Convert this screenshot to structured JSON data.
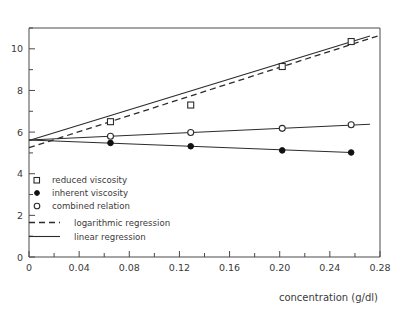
{
  "chart_data": {
    "type": "scatter",
    "title": "",
    "xlabel": "concentration (g/dl)",
    "ylabel": "",
    "xlim": [
      0,
      0.28
    ],
    "ylim": [
      0,
      11
    ],
    "grid": false,
    "legend_position": "inside-lower-left",
    "x_ticks": [
      "0",
      "0.04",
      "0.08",
      "0.12",
      "0.16",
      "0.20",
      "0.24",
      "0.28"
    ],
    "x_tick_values": [
      0,
      0.04,
      0.08,
      0.12,
      0.16,
      0.2,
      0.24,
      0.28
    ],
    "x_minor_tick_values": [
      0.02,
      0.06,
      0.1,
      0.14,
      0.18,
      0.22,
      0.26
    ],
    "y_ticks": [
      "0",
      "2",
      "4",
      "6",
      "8",
      "10"
    ],
    "y_tick_values": [
      0,
      2,
      4,
      6,
      8,
      10
    ],
    "y_minor_tick_values": [
      1,
      3,
      5,
      7,
      9,
      11
    ],
    "series": [
      {
        "name": "reduced viscosity",
        "marker": "open-square",
        "x": [
          0.065,
          0.129,
          0.202,
          0.257
        ],
        "values": [
          6.5,
          7.3,
          9.15,
          10.35
        ]
      },
      {
        "name": "inherent viscosity",
        "marker": "filled-circle",
        "x": [
          0.065,
          0.129,
          0.202,
          0.257
        ],
        "values": [
          5.48,
          5.32,
          5.12,
          5.02
        ]
      },
      {
        "name": "combined relation",
        "marker": "open-circle",
        "x": [
          0.065,
          0.129,
          0.202,
          0.257
        ],
        "values": [
          5.8,
          5.98,
          6.18,
          6.35
        ]
      }
    ],
    "fits": [
      {
        "name": "logarithmic regression",
        "style": "dashed",
        "applies_to": "reduced viscosity",
        "x": [
          0.0,
          0.28
        ],
        "values": [
          5.25,
          10.65
        ]
      },
      {
        "name": "linear regression (reduced viscosity)",
        "style": "solid",
        "applies_to": "reduced viscosity",
        "x": [
          0.0,
          0.272
        ],
        "values": [
          5.6,
          10.62
        ]
      },
      {
        "name": "linear regression (inherent viscosity)",
        "style": "solid",
        "applies_to": "inherent viscosity",
        "x": [
          0.0,
          0.257
        ],
        "values": [
          5.62,
          5.02
        ]
      },
      {
        "name": "linear regression (combined relation)",
        "style": "solid",
        "applies_to": "combined relation",
        "x": [
          0.0,
          0.272
        ],
        "values": [
          5.62,
          6.38
        ]
      }
    ],
    "legend": [
      {
        "label": "reduced viscosity",
        "marker": "open-square"
      },
      {
        "label": "inherent viscosity",
        "marker": "filled-circle"
      },
      {
        "label": "combined relation",
        "marker": "open-circle"
      },
      {
        "label": "logarithmic regression",
        "marker": "dashed-line"
      },
      {
        "label": "linear regression",
        "marker": "solid-line"
      }
    ],
    "colors": {
      "axis": "#4a4a4a",
      "data": "#2b2b2b",
      "text": "#3a3a3a",
      "background": "#ffffff"
    }
  }
}
